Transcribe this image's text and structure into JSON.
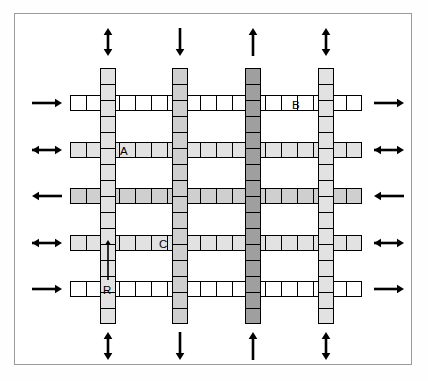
{
  "figure": {
    "type": "grid-network-diagram",
    "title": "",
    "background_color": "#ffffff",
    "frame_color": "#9a9a9a",
    "line_color": "#000000"
  },
  "palette": {
    "white": "#ffffff",
    "light_gray": "#e2e2e2",
    "mid_gray": "#cfcfcf",
    "dark_gray": "#9f9f9f",
    "black": "#000000"
  },
  "geometry": {
    "width": 428,
    "height": 381,
    "cell_size": 16,
    "road_thickness": 16,
    "row_y": [
      95,
      142,
      188,
      235,
      281
    ],
    "col_x": [
      100,
      172,
      245,
      318
    ],
    "grid_left": 70,
    "grid_right": 362,
    "grid_top": 68,
    "grid_bottom": 324
  },
  "horizontal_roads": [
    {
      "id": "row-1",
      "index": 0,
      "y": 95,
      "x": 70,
      "length": 292,
      "cells": 18,
      "shade": "white",
      "left_arrow": "right",
      "right_arrow": "right"
    },
    {
      "id": "row-2",
      "index": 1,
      "y": 142,
      "x": 70,
      "length": 292,
      "cells": 18,
      "shade": "light_gray",
      "left_arrow": "both",
      "right_arrow": "both"
    },
    {
      "id": "row-3",
      "index": 2,
      "y": 188,
      "x": 70,
      "length": 292,
      "cells": 18,
      "shade": "mid_gray",
      "left_arrow": "left",
      "right_arrow": "left"
    },
    {
      "id": "row-4",
      "index": 3,
      "y": 235,
      "x": 70,
      "length": 292,
      "cells": 18,
      "shade": "light_gray",
      "left_arrow": "both",
      "right_arrow": "both"
    },
    {
      "id": "row-5",
      "index": 4,
      "y": 281,
      "x": 70,
      "length": 292,
      "cells": 18,
      "shade": "white",
      "left_arrow": "right",
      "right_arrow": "right"
    }
  ],
  "vertical_roads": [
    {
      "id": "col-1",
      "index": 0,
      "x": 100,
      "y": 68,
      "length": 256,
      "cells": 16,
      "shade": "light_gray",
      "top_arrow": "both",
      "bottom_arrow": "both"
    },
    {
      "id": "col-2",
      "index": 1,
      "x": 172,
      "y": 68,
      "length": 256,
      "cells": 16,
      "shade": "mid_gray",
      "top_arrow": "down",
      "bottom_arrow": "down"
    },
    {
      "id": "col-3",
      "index": 2,
      "x": 245,
      "y": 68,
      "length": 256,
      "cells": 16,
      "shade": "dark_gray",
      "top_arrow": "up",
      "bottom_arrow": "up"
    },
    {
      "id": "col-4",
      "index": 3,
      "x": 318,
      "y": 68,
      "length": 256,
      "cells": 16,
      "shade": "light_gray",
      "top_arrow": "both",
      "bottom_arrow": "both"
    }
  ],
  "labels": [
    {
      "id": "label-A",
      "text": "A",
      "x": 120,
      "y": 146,
      "on": "row-2"
    },
    {
      "id": "label-B",
      "text": "B",
      "x": 292,
      "y": 100,
      "on": "row-1"
    },
    {
      "id": "label-C",
      "text": "C",
      "x": 159,
      "y": 239,
      "on": "row-4"
    },
    {
      "id": "label-R",
      "text": "R",
      "x": 103,
      "y": 285,
      "on": "col-1"
    }
  ],
  "inner_arrow": {
    "id": "link-direction-arrow-R",
    "direction": "up",
    "x": 108,
    "y_top": 238,
    "y_bottom": 282,
    "on": "col-1",
    "note": "upward arrow spanning link R"
  },
  "edge_arrows": {
    "left": [
      "right",
      "both",
      "left",
      "both",
      "right"
    ],
    "right": [
      "right",
      "both",
      "left",
      "both",
      "right"
    ],
    "top": [
      "both",
      "down",
      "up",
      "both"
    ],
    "bottom": [
      "both",
      "down",
      "up",
      "both"
    ]
  }
}
